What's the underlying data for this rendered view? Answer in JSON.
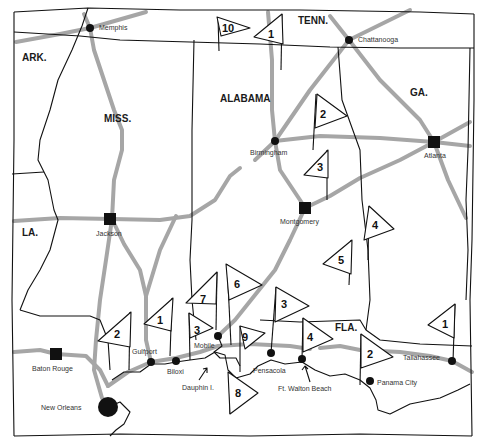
{
  "map": {
    "states": [
      {
        "id": "ark",
        "label": "ARK.",
        "x": 22,
        "y": 61
      },
      {
        "id": "tenn",
        "label": "TENN.",
        "x": 298,
        "y": 24
      },
      {
        "id": "miss",
        "label": "MISS.",
        "x": 104,
        "y": 122
      },
      {
        "id": "alabama",
        "label": "ALABAMA",
        "x": 220,
        "y": 102
      },
      {
        "id": "ga",
        "label": "GA.",
        "x": 410,
        "y": 96
      },
      {
        "id": "la",
        "label": "LA.",
        "x": 22,
        "y": 236
      },
      {
        "id": "fla",
        "label": "FLA.",
        "x": 335,
        "y": 331
      }
    ],
    "cities": [
      {
        "id": "memphis",
        "label": "Memphis",
        "type": "dot",
        "x": 90,
        "y": 28,
        "label_x": 99,
        "label_y": 30
      },
      {
        "id": "chattanooga",
        "label": "Chattanooga",
        "type": "dot",
        "x": 349,
        "y": 40,
        "label_x": 358,
        "label_y": 42
      },
      {
        "id": "birmingham",
        "label": "Birmingham",
        "type": "dot",
        "x": 275,
        "y": 141,
        "label_x": 250,
        "label_y": 155
      },
      {
        "id": "atlanta",
        "label": "Atlanta",
        "type": "square",
        "x": 434,
        "y": 142,
        "label_x": 424,
        "label_y": 158
      },
      {
        "id": "jackson",
        "label": "Jackson",
        "type": "square",
        "x": 110,
        "y": 219,
        "label_x": 96,
        "label_y": 236
      },
      {
        "id": "montgomery",
        "label": "Montgomery",
        "type": "square",
        "x": 305,
        "y": 208,
        "label_x": 280,
        "label_y": 224
      },
      {
        "id": "baton-rouge",
        "label": "Baton Rouge",
        "type": "square",
        "x": 56,
        "y": 354,
        "label_x": 32,
        "label_y": 371
      },
      {
        "id": "gulfport",
        "label": "Gulfport",
        "type": "dot",
        "x": 151,
        "y": 362,
        "label_x": 132,
        "label_y": 354
      },
      {
        "id": "biloxi",
        "label": "Biloxi",
        "type": "dot",
        "x": 176,
        "y": 361,
        "label_x": 167,
        "label_y": 374
      },
      {
        "id": "mobile",
        "label": "Mobile",
        "type": "dot",
        "x": 218,
        "y": 336,
        "label_x": 194,
        "label_y": 348
      },
      {
        "id": "new-orleans",
        "label": "New Orleans",
        "type": "bigdot",
        "x": 108,
        "y": 407,
        "label_x": 41,
        "label_y": 410
      },
      {
        "id": "pensacola",
        "label": "Pensacola",
        "type": "dot",
        "x": 271,
        "y": 353,
        "label_x": 253,
        "label_y": 373
      },
      {
        "id": "ft-walton-beach",
        "label": "Ft. Walton Beach",
        "type": "dot",
        "x": 302,
        "y": 359,
        "label_x": 278,
        "label_y": 391
      },
      {
        "id": "panama-city",
        "label": "Panama City",
        "type": "dot",
        "x": 370,
        "y": 381,
        "label_x": 377,
        "label_y": 385
      },
      {
        "id": "tallahassee",
        "label": "Tallahassee",
        "type": "dot",
        "x": 452,
        "y": 361,
        "label_x": 403,
        "label_y": 360
      },
      {
        "id": "dauphin-island",
        "label": "Dauphin I.",
        "type": "none",
        "x": 206,
        "y": 347,
        "label_x": 182,
        "label_y": 390
      }
    ],
    "flags": [
      {
        "number": "10",
        "x": 228,
        "y": 27
      },
      {
        "number": "1",
        "x": 271,
        "y": 34
      },
      {
        "number": "2",
        "x": 324,
        "y": 113
      },
      {
        "number": "3",
        "x": 321,
        "y": 167
      },
      {
        "number": "4",
        "x": 376,
        "y": 225
      },
      {
        "number": "5",
        "x": 342,
        "y": 260
      },
      {
        "number": "2",
        "x": 118,
        "y": 333
      },
      {
        "number": "1",
        "x": 159,
        "y": 319
      },
      {
        "number": "7",
        "x": 207,
        "y": 298
      },
      {
        "number": "6",
        "x": 238,
        "y": 284
      },
      {
        "number": "3",
        "x": 199,
        "y": 329
      },
      {
        "number": "9",
        "x": 247,
        "y": 336
      },
      {
        "number": "3",
        "x": 285,
        "y": 302
      },
      {
        "number": "4",
        "x": 311,
        "y": 337
      },
      {
        "number": "8",
        "x": 239,
        "y": 393
      },
      {
        "number": "2",
        "x": 371,
        "y": 354
      },
      {
        "number": "1",
        "x": 446,
        "y": 325
      }
    ],
    "colors": {
      "border": "#111111",
      "road": "#a6a6a6",
      "background": "#ffffff"
    }
  }
}
